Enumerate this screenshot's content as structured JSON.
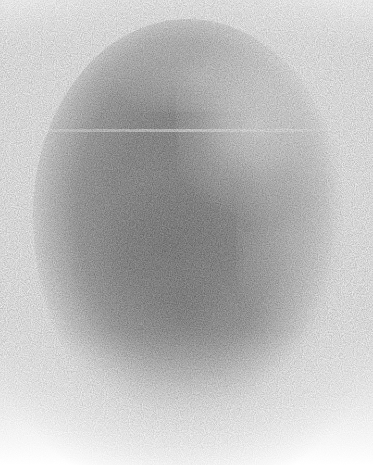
{
  "image": {
    "kind": "grayscale-scan-image",
    "description": "Noisy grayscale oval / egg-shaped intensity blob on a white background",
    "modality_look": "nuclear-medicine-style planar scintigraphy scan",
    "width": 373,
    "height": 465,
    "background_color": "#ffffff",
    "colorspace": "grayscale",
    "has_text": false,
    "has_axes": false,
    "has_legend": false,
    "has_annotations": false
  },
  "region": {
    "shape": "oval",
    "label": "main-intensity-blob",
    "bounds": {
      "left": 35,
      "top": 22,
      "right": 340,
      "bottom": 440
    },
    "center": {
      "x": 188,
      "y": 230
    },
    "width": 305,
    "height": 418,
    "edge_top": "sharp",
    "edge_upper_left": "sharp",
    "edge_right": "soft",
    "edge_bottom": "very-diffuse"
  },
  "features": [
    {
      "name": "bright-highlight-upper-right",
      "center": {
        "x": 262,
        "y": 116
      },
      "tone": "bright",
      "hex": "#ededed"
    },
    {
      "name": "dense-core-center",
      "center": {
        "x": 172,
        "y": 258
      },
      "tone": "darkest",
      "hex": "#8a8a8a"
    },
    {
      "name": "dense-lobe-lower-center",
      "center": {
        "x": 186,
        "y": 316
      },
      "tone": "dark",
      "hex": "#959595"
    },
    {
      "name": "detector-seam-line",
      "orientation": "horizontal",
      "y": 130,
      "x_start": 22,
      "x_end": 352,
      "tone": "bright-thin-line",
      "hex": "#f2f2f2"
    },
    {
      "name": "bottom-falloff-washout",
      "y_start": 360,
      "y_end": 460,
      "tone": "fades-to-white"
    }
  ],
  "tones": {
    "background": "#ffffff",
    "corner": "#fdfdfd",
    "rim": "#d8d8d8",
    "midtone": "#b4b4b4",
    "core": "#8a8a8a",
    "highlight": "#f0f0f0"
  },
  "noise": {
    "type": "per-pixel-monochrome-grain",
    "character": "high-frequency counting noise, uniform across the blob",
    "strength": 0.5,
    "grain_scale": "1px"
  }
}
